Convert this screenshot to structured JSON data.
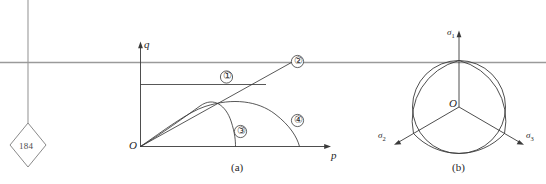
{
  "figure": {
    "page_marker": {
      "number": "184",
      "shape": "diamond"
    },
    "panel_a": {
      "caption": "(a)",
      "x_axis_label": "p",
      "y_axis_label": "q",
      "origin_label": "O",
      "curve_labels": [
        "①",
        "②",
        "③",
        "④"
      ],
      "curve_label_names": [
        "curve-label-1",
        "curve-label-2",
        "curve-label-3",
        "curve-label-4"
      ]
    },
    "panel_b": {
      "caption": "(b)",
      "origin_label": "O",
      "axis_labels": [
        {
          "base": "σ",
          "sub": "1"
        },
        {
          "base": "σ",
          "sub": "2"
        },
        {
          "base": "σ",
          "sub": "3"
        }
      ]
    },
    "colors": {
      "ink": "#262626",
      "line": "#3a3a3a",
      "rule": "#8c8c8c",
      "background": "#ffffff"
    }
  }
}
